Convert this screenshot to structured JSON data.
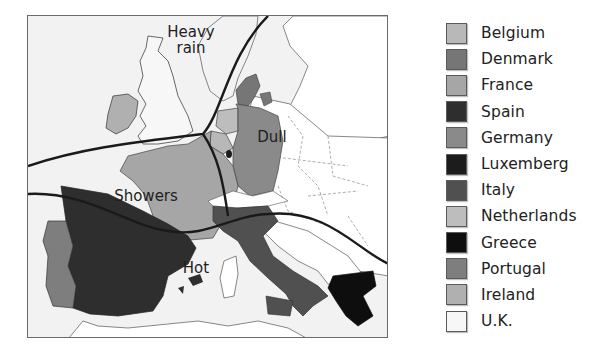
{
  "map": {
    "zones": [
      {
        "id": "heavy-rain",
        "label_line1": "Heavy",
        "label_line2": "rain"
      },
      {
        "id": "dull",
        "label": "Dull"
      },
      {
        "id": "showers",
        "label": "Showers"
      },
      {
        "id": "hot",
        "label": "Hot"
      }
    ],
    "colors": {
      "sea": "#f2f2f2",
      "land_other": "#ffffff",
      "boundary_line": "#1a1a1a"
    }
  },
  "legend": {
    "items": [
      {
        "label": "Belgium",
        "color": "#b8b8b8"
      },
      {
        "label": "Denmark",
        "color": "#767676"
      },
      {
        "label": "France",
        "color": "#a6a6a6"
      },
      {
        "label": "Spain",
        "color": "#2e2e2e"
      },
      {
        "label": "Germany",
        "color": "#8a8a8a"
      },
      {
        "label": "Luxemberg",
        "color": "#1c1c1c"
      },
      {
        "label": "Italy",
        "color": "#505050"
      },
      {
        "label": "Netherlands",
        "color": "#bdbdbd"
      },
      {
        "label": "Greece",
        "color": "#0e0e0e"
      },
      {
        "label": "Portugal",
        "color": "#7e7e7e"
      },
      {
        "label": "Ireland",
        "color": "#b0b0b0"
      },
      {
        "label": "U.K.",
        "color": "#f7f7f7"
      }
    ]
  }
}
